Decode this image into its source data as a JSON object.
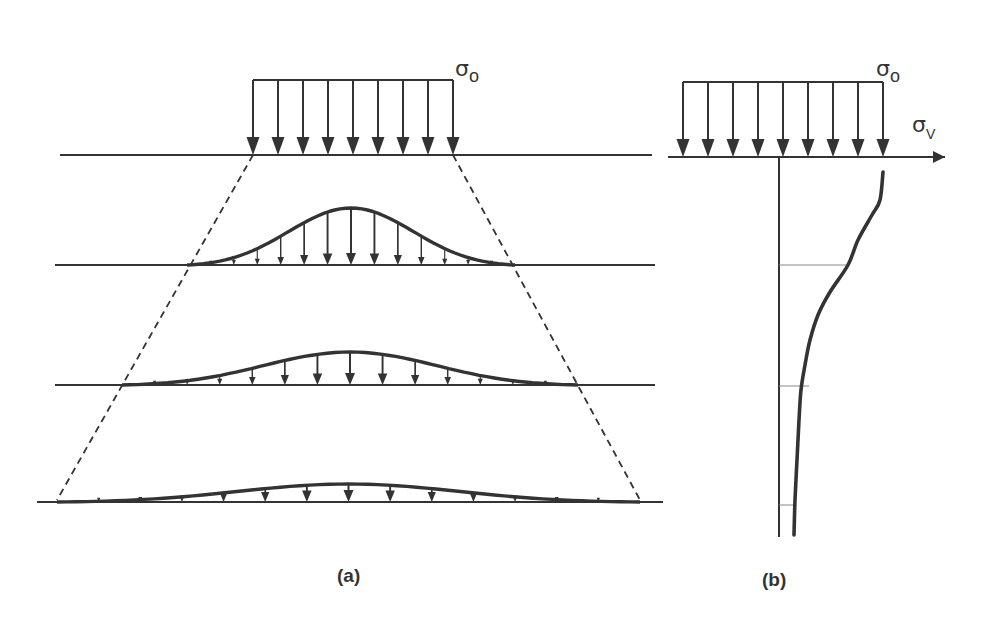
{
  "figure": {
    "colors": {
      "ink": "#333333",
      "thin_line": "#888888",
      "background": "#ffffff"
    },
    "panel_a": {
      "caption": "(a)",
      "load_label": {
        "symbol": "σ",
        "subscript": "o"
      },
      "surface_load": {
        "x_start": 253,
        "x_end": 453,
        "top_y": 80,
        "base_y": 155,
        "arrow_count": 9
      },
      "ground_lines": [
        {
          "y": 155,
          "x1": 60,
          "x2": 652
        },
        {
          "y": 265,
          "x1": 55,
          "x2": 655
        },
        {
          "y": 385,
          "x1": 55,
          "x2": 655
        },
        {
          "y": 502,
          "x1": 37,
          "x2": 663
        }
      ],
      "spread_lines": [
        {
          "from": [
            253,
            155
          ],
          "to": [
            57,
            500
          ],
          "style": "dashed"
        },
        {
          "from": [
            453,
            155
          ],
          "to": [
            640,
            500
          ],
          "style": "dashed"
        }
      ],
      "stress_bulbs": [
        {
          "level_y": 265,
          "x_start": 187,
          "x_end": 515,
          "peak_height": 57,
          "arrow_count": 13
        },
        {
          "level_y": 385,
          "x_start": 122,
          "x_end": 578,
          "peak_height": 33,
          "arrow_count": 13
        },
        {
          "level_y": 502,
          "x_start": 57,
          "x_end": 640,
          "peak_height": 18,
          "arrow_count": 13
        }
      ]
    },
    "panel_b": {
      "caption": "(b)",
      "load_label": {
        "symbol": "σ",
        "subscript": "o"
      },
      "axis_label": {
        "symbol": "σ",
        "subscript": "V"
      },
      "surface_load": {
        "x_start": 683,
        "x_end": 883,
        "top_y": 82,
        "base_y": 157,
        "arrow_count": 9
      },
      "horizontal_axis": {
        "y": 157,
        "x1": 668,
        "x2": 945
      },
      "vertical_axis": {
        "x": 779,
        "y1": 157,
        "y2": 537
      },
      "depth_markers": [
        {
          "y": 265,
          "x_end": 848
        },
        {
          "y": 386,
          "x_end": 809
        },
        {
          "y": 505,
          "x_end": 795
        }
      ],
      "stress_curve_points": [
        [
          883,
          172
        ],
        [
          880,
          200
        ],
        [
          872,
          215
        ],
        [
          858,
          240
        ],
        [
          848,
          265
        ],
        [
          830,
          292
        ],
        [
          818,
          315
        ],
        [
          810,
          340
        ],
        [
          805,
          365
        ],
        [
          801,
          390
        ],
        [
          799,
          420
        ],
        [
          797,
          460
        ],
        [
          795,
          500
        ],
        [
          794,
          535
        ]
      ]
    }
  }
}
